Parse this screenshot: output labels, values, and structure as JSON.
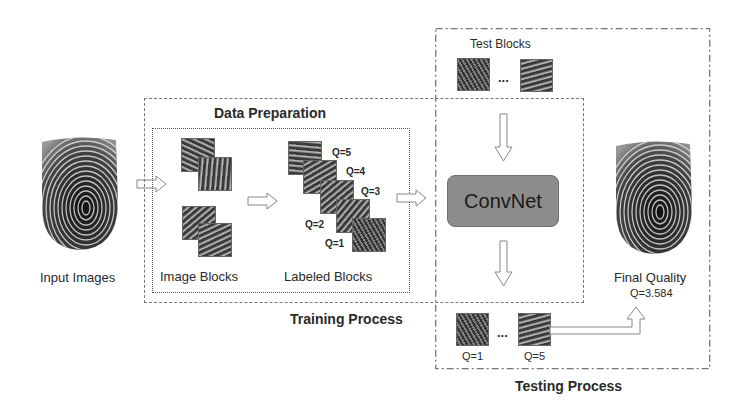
{
  "diagram": {
    "input": {
      "label": "Input Images"
    },
    "training": {
      "title": "Training Process",
      "data_preparation": {
        "title": "Data Preparation",
        "image_blocks_label": "Image Blocks",
        "labeled_blocks_label": "Labeled Blocks",
        "quality_labels": [
          "Q=5",
          "Q=4",
          "Q=3",
          "Q=2",
          "Q=1"
        ]
      }
    },
    "testing": {
      "title": "Testing Process",
      "test_blocks_label": "Test Blocks",
      "ellipsis": "...",
      "model_label": "ConvNet",
      "output_labels": [
        "Q=1",
        "Q=5"
      ],
      "output_ellipsis": "..."
    },
    "output": {
      "label": "Final Quality",
      "value": "Q=3.584"
    },
    "colors": {
      "convnet_fill": "#8c8c8c",
      "box_border": "#777777",
      "arrow_stroke": "#888888"
    }
  }
}
